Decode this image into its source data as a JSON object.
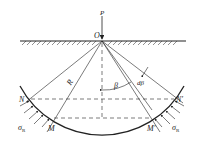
{
  "diagram": {
    "labels": {
      "P": "P",
      "O": "O",
      "R": "R",
      "beta": "β",
      "dbeta": "dβ",
      "N": "N",
      "N_prime": "N′",
      "M": "M",
      "M_prime": "M′",
      "sigma_left": "σ",
      "sigma_left_sub": "R",
      "sigma_right": "σ",
      "sigma_right_sub": "R"
    },
    "colors": {
      "stroke": "#222222",
      "background": "#ffffff"
    }
  }
}
